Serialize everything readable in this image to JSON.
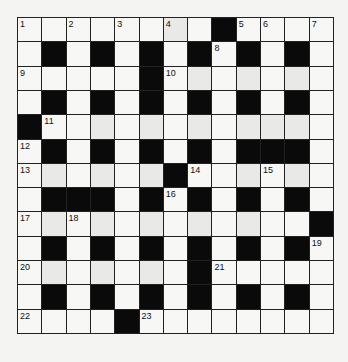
{
  "puzzle": {
    "type": "crossword",
    "rows": 13,
    "cols": 13,
    "grid": [
      "........#....",
      ".#.#.#.#.#.#.",
      ".....#.......",
      ".#.#.#.#.#.#.",
      "#............",
      ".#.#.#.#.###.",
      "......#......",
      ".###.#.#.#.#.",
      "............#",
      ".#.#.#.#.#.#.",
      ".......#.....",
      ".#.#.#.#.#.#.",
      "....#........"
    ],
    "numbers": [
      {
        "n": "1",
        "r": 0,
        "c": 0
      },
      {
        "n": "2",
        "r": 0,
        "c": 2
      },
      {
        "n": "3",
        "r": 0,
        "c": 4
      },
      {
        "n": "4",
        "r": 0,
        "c": 6
      },
      {
        "n": "5",
        "r": 0,
        "c": 9
      },
      {
        "n": "6",
        "r": 0,
        "c": 10
      },
      {
        "n": "7",
        "r": 0,
        "c": 12
      },
      {
        "n": "8",
        "r": 1,
        "c": 8
      },
      {
        "n": "9",
        "r": 2,
        "c": 0
      },
      {
        "n": "10",
        "r": 2,
        "c": 6
      },
      {
        "n": "11",
        "r": 4,
        "c": 1
      },
      {
        "n": "12",
        "r": 5,
        "c": 0
      },
      {
        "n": "13",
        "r": 6,
        "c": 0
      },
      {
        "n": "14",
        "r": 6,
        "c": 7
      },
      {
        "n": "15",
        "r": 6,
        "c": 10
      },
      {
        "n": "16",
        "r": 7,
        "c": 6
      },
      {
        "n": "17",
        "r": 8,
        "c": 0
      },
      {
        "n": "18",
        "r": 8,
        "c": 2
      },
      {
        "n": "19",
        "r": 9,
        "c": 12
      },
      {
        "n": "20",
        "r": 10,
        "c": 0
      },
      {
        "n": "21",
        "r": 10,
        "c": 8
      },
      {
        "n": "22",
        "r": 12,
        "c": 0
      },
      {
        "n": "23",
        "r": 12,
        "c": 5
      }
    ],
    "shaded": [
      [
        0,
        6
      ],
      [
        2,
        7
      ],
      [
        2,
        9
      ],
      [
        2,
        11
      ],
      [
        4,
        3
      ],
      [
        4,
        5
      ],
      [
        4,
        7
      ],
      [
        4,
        9
      ],
      [
        4,
        10
      ],
      [
        4,
        11
      ],
      [
        6,
        1
      ],
      [
        6,
        3
      ],
      [
        6,
        5
      ],
      [
        6,
        9
      ],
      [
        6,
        11
      ],
      [
        8,
        1
      ],
      [
        8,
        3
      ],
      [
        8,
        5
      ],
      [
        8,
        7
      ],
      [
        8,
        9
      ],
      [
        10,
        1
      ],
      [
        10,
        3
      ],
      [
        10,
        5
      ]
    ],
    "colors": {
      "black": "#0a0a0a",
      "white": "#f7f7f5",
      "shade": "#e9e9e7",
      "line": "#222222",
      "background": "#f4f4f2"
    }
  }
}
